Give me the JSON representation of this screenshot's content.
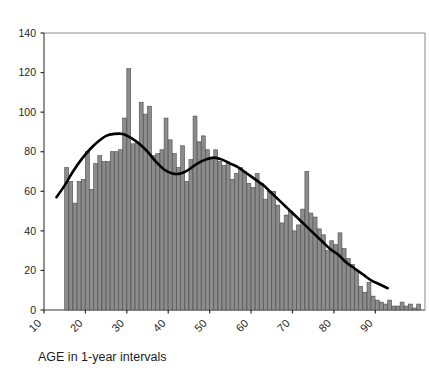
{
  "chart_data": {
    "type": "bar",
    "title": "",
    "subtitle": "",
    "xlabel": "AGE in 1-year intervals",
    "ylabel": "",
    "xlim": [
      10,
      102
    ],
    "ylim": [
      0,
      140
    ],
    "grid": false,
    "legend": null,
    "x_ticks": [
      10,
      20,
      30,
      40,
      50,
      60,
      70,
      80,
      90
    ],
    "x_tick_labels": [
      "10",
      "20",
      "30",
      "40",
      "50",
      "60",
      "70",
      "80",
      "90"
    ],
    "y_ticks": [
      0,
      20,
      40,
      60,
      80,
      100,
      120,
      140
    ],
    "y_tick_labels": [
      "0",
      "20",
      "40",
      "60",
      "80",
      "100",
      "120",
      "140"
    ],
    "bar_color": "#8c8c8c",
    "bar_edge_color": "#4a4a4a",
    "curve_color": "#000000",
    "axis_color": "#3a3a3a",
    "categories": [
      15,
      16,
      17,
      18,
      19,
      20,
      21,
      22,
      23,
      24,
      25,
      26,
      27,
      28,
      29,
      30,
      31,
      32,
      33,
      34,
      35,
      36,
      37,
      38,
      39,
      40,
      41,
      42,
      43,
      44,
      45,
      46,
      47,
      48,
      49,
      50,
      51,
      52,
      53,
      54,
      55,
      56,
      57,
      58,
      59,
      60,
      61,
      62,
      63,
      64,
      65,
      66,
      67,
      68,
      69,
      70,
      71,
      72,
      73,
      74,
      75,
      76,
      77,
      78,
      79,
      80,
      81,
      82,
      83,
      84,
      85,
      86,
      87,
      88,
      89,
      90,
      91,
      92,
      93,
      94,
      95,
      96,
      97,
      98,
      99,
      100
    ],
    "values": [
      72,
      65,
      54,
      65,
      66,
      80,
      61,
      74,
      78,
      75,
      75,
      80,
      80,
      81,
      97,
      122,
      84,
      85,
      105,
      99,
      103,
      78,
      79,
      81,
      97,
      86,
      79,
      72,
      83,
      65,
      76,
      98,
      85,
      88,
      81,
      76,
      81,
      75,
      73,
      74,
      66,
      69,
      72,
      70,
      64,
      62,
      69,
      64,
      56,
      60,
      60,
      53,
      44,
      48,
      50,
      40,
      43,
      51,
      70,
      49,
      47,
      41,
      38,
      30,
      35,
      33,
      39,
      31,
      26,
      23,
      20,
      12,
      9,
      14,
      7,
      5,
      4,
      3,
      5,
      2,
      2,
      4,
      2,
      3,
      1,
      3
    ],
    "series_note": "Histogram of AGE, 1-year bins, with overlaid smoothed density curve",
    "curve": {
      "name": "smoothed density",
      "x": [
        13,
        15,
        17,
        19,
        21,
        23,
        25,
        27,
        29,
        31,
        33,
        35,
        37,
        39,
        41,
        43,
        45,
        47,
        49,
        51,
        53,
        55,
        57,
        59,
        61,
        63,
        65,
        67,
        69,
        71,
        73,
        75,
        77,
        79,
        81,
        83,
        85,
        87,
        89,
        91,
        93
      ],
      "y": [
        57,
        63,
        70,
        76,
        81,
        85,
        88,
        89,
        89,
        87,
        84,
        80,
        75,
        71,
        69,
        69,
        71,
        74,
        76,
        77,
        76,
        74,
        72,
        69,
        66,
        63,
        59,
        55,
        51,
        47,
        43,
        39,
        35,
        31,
        28,
        24,
        21,
        18,
        15,
        13,
        11
      ]
    }
  }
}
